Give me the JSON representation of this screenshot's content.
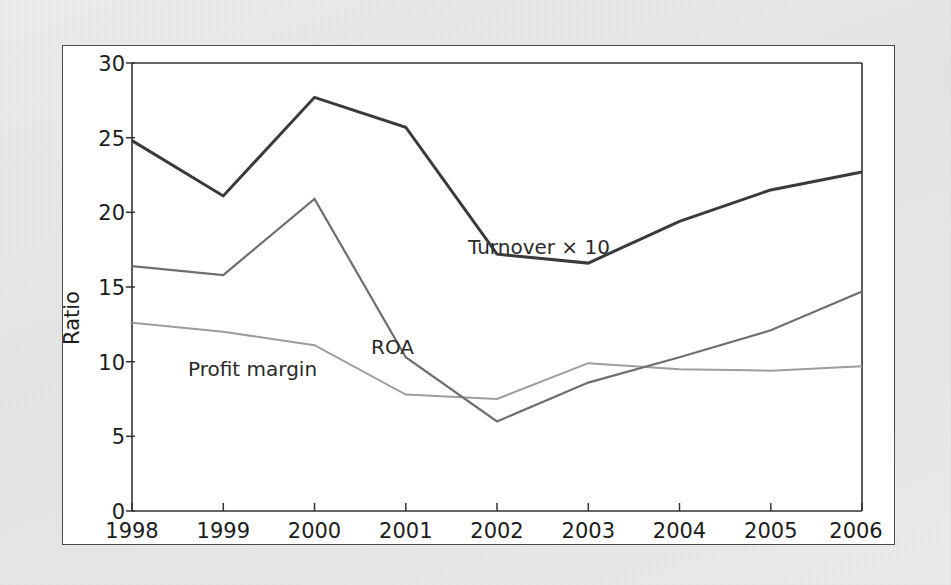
{
  "figure": {
    "background_color": "#e9e9e9",
    "panel_color": "#ffffff",
    "border_color": "#4a4a4a"
  },
  "axes": {
    "y_title": "Ratio",
    "y_ticks": [
      "0",
      "5",
      "10",
      "15",
      "20",
      "25",
      "30"
    ],
    "x_ticks": [
      "1998",
      "1999",
      "2000",
      "2001",
      "2002",
      "2003",
      "2004",
      "2005",
      "2006"
    ]
  },
  "annotations": {
    "turnover": "Turnover × 10",
    "roa": "ROA",
    "profit_margin": "Profit margin"
  },
  "chart_data": {
    "type": "line",
    "title": "",
    "xlabel": "",
    "ylabel": "Ratio",
    "xlim": [
      1998,
      2006
    ],
    "ylim": [
      0,
      30
    ],
    "ytick_values": [
      0,
      5,
      10,
      15,
      20,
      25,
      30
    ],
    "grid": false,
    "legend": "inline-annotations",
    "x": [
      1998,
      1999,
      2000,
      2001,
      2002,
      2003,
      2004,
      2005,
      2006
    ],
    "categories": [
      "1998",
      "1999",
      "2000",
      "2001",
      "2002",
      "2003",
      "2004",
      "2005",
      "2006"
    ],
    "series": [
      {
        "name": "Turnover × 10",
        "color": "#3a3a3a",
        "line_width": 3.0,
        "values": [
          24.8,
          21.1,
          27.7,
          25.7,
          17.2,
          16.6,
          19.4,
          21.5,
          22.7
        ]
      },
      {
        "name": "ROA",
        "color": "#6e6e6e",
        "line_width": 2.2,
        "values": [
          16.4,
          15.8,
          20.9,
          10.3,
          6.0,
          8.6,
          10.3,
          12.1,
          14.7
        ]
      },
      {
        "name": "Profit margin",
        "color": "#9d9d9d",
        "line_width": 2.0,
        "values": [
          12.6,
          12.0,
          11.1,
          7.8,
          7.5,
          9.9,
          9.5,
          9.4,
          9.7
        ]
      }
    ]
  }
}
